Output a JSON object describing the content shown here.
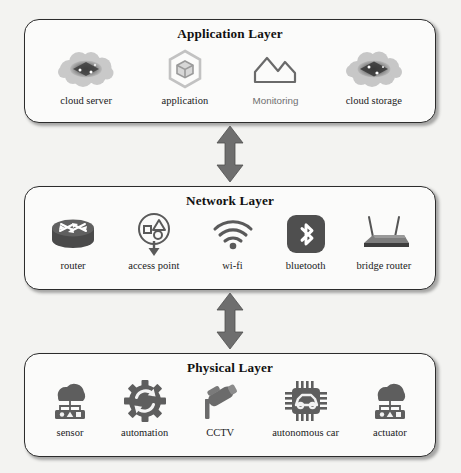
{
  "diagram": {
    "background_color": "#f3f3f1",
    "box_border_color": "#2c2c2c",
    "box_fill_color": "#fbfbfa",
    "arrow_color": "#6e6e6e",
    "icon_color": "#5a5a5a"
  },
  "layers": [
    {
      "id": "application",
      "title": "Application Layer",
      "items": [
        {
          "label": "cloud server",
          "icon": "cloud-server-icon",
          "label_style": "serif"
        },
        {
          "label": "application",
          "icon": "hexagon-cube-icon",
          "label_style": "serif"
        },
        {
          "label": "Monitoring",
          "icon": "mountain-chart-icon",
          "label_style": "sans-gray"
        },
        {
          "label": "cloud storage",
          "icon": "cloud-storage-icon",
          "label_style": "serif"
        }
      ]
    },
    {
      "id": "network",
      "title": "Network Layer",
      "items": [
        {
          "label": "router",
          "icon": "router-icon",
          "label_style": "serif"
        },
        {
          "label": "access point",
          "icon": "access-point-icon",
          "label_style": "serif"
        },
        {
          "label": "wi-fi",
          "icon": "wifi-icon",
          "label_style": "serif"
        },
        {
          "label": "bluetooth",
          "icon": "bluetooth-icon",
          "label_style": "serif"
        },
        {
          "label": "bridge router",
          "icon": "bridge-router-icon",
          "label_style": "serif"
        }
      ]
    },
    {
      "id": "physical",
      "title": "Physical Layer",
      "items": [
        {
          "label": "sensor",
          "icon": "sensor-icon",
          "label_style": "serif"
        },
        {
          "label": "automation",
          "icon": "automation-gear-icon",
          "label_style": "serif"
        },
        {
          "label": "CCTV",
          "icon": "cctv-camera-icon",
          "label_style": "serif"
        },
        {
          "label": "autonomous car",
          "icon": "autonomous-car-icon",
          "label_style": "serif"
        },
        {
          "label": "actuator",
          "icon": "actuator-icon",
          "label_style": "serif"
        }
      ]
    }
  ],
  "connectors": [
    {
      "id": "application-network",
      "type": "double-headed-arrow",
      "direction": "vertical"
    },
    {
      "id": "network-physical",
      "type": "double-headed-arrow",
      "direction": "vertical"
    }
  ]
}
